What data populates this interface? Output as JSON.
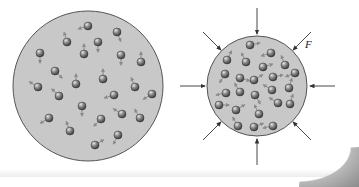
{
  "diagram": {
    "colors": {
      "container_fill": "#c8c8c8",
      "container_stroke": "#555555",
      "particle_fill": "#6f6f6f",
      "particle_highlight": "#d8d8d8",
      "velocity_arrow": "#8a8a8a",
      "force_arrow": "#333333"
    },
    "left_container": {
      "label": "uncompressed gas",
      "cx": 88,
      "cy": 86,
      "r": 75,
      "particles": [
        [
          88,
          26,
          -1,
          0.3
        ],
        [
          67,
          42,
          -0.3,
          -1
        ],
        [
          117,
          32,
          0.4,
          1
        ],
        [
          98,
          42,
          0,
          1
        ],
        [
          40,
          53,
          0,
          1
        ],
        [
          84,
          54,
          0,
          -1
        ],
        [
          121,
          55,
          0,
          1
        ],
        [
          141,
          62,
          0,
          -1
        ],
        [
          55,
          71,
          1,
          1
        ],
        [
          103,
          79,
          0,
          -1
        ],
        [
          76,
          84,
          0,
          -1
        ],
        [
          38,
          87,
          -1,
          -0.6
        ],
        [
          135,
          87,
          -0.4,
          -1
        ],
        [
          59,
          96,
          -0.8,
          -0.8
        ],
        [
          114,
          95,
          -1,
          0.3
        ],
        [
          152,
          94,
          -1,
          0.6
        ],
        [
          82,
          106,
          0,
          1
        ],
        [
          122,
          114,
          -1,
          -0.6
        ],
        [
          140,
          118,
          -0.6,
          -1
        ],
        [
          49,
          118,
          -1,
          0.6
        ],
        [
          101,
          119,
          -1,
          1
        ],
        [
          70,
          131,
          -0.4,
          -1
        ],
        [
          118,
          135,
          -0.5,
          1
        ],
        [
          95,
          145,
          1,
          -0.6
        ]
      ]
    },
    "right_container": {
      "label": "compressed gas",
      "cx": 257,
      "cy": 86,
      "r": 50,
      "particles": [
        [
          250,
          45,
          1,
          -0.2
        ],
        [
          271,
          53,
          -1,
          0.3
        ],
        [
          227,
          60,
          0.5,
          -1
        ],
        [
          246,
          62,
          -0.5,
          -1
        ],
        [
          263,
          67,
          1,
          -0.3
        ],
        [
          285,
          65,
          -0.4,
          -1
        ],
        [
          225,
          74,
          -0.6,
          1
        ],
        [
          240,
          78,
          1,
          0.3
        ],
        [
          254,
          80,
          1,
          -0.6
        ],
        [
          273,
          77,
          1,
          -0.2
        ],
        [
          295,
          73,
          -1,
          0.4
        ],
        [
          226,
          93,
          -1,
          0.2
        ],
        [
          240,
          92,
          -0.6,
          -1
        ],
        [
          255,
          95,
          0.6,
          1
        ],
        [
          272,
          90,
          -1,
          -0.6
        ],
        [
          289,
          88,
          0.3,
          -1
        ],
        [
          219,
          105,
          1,
          0
        ],
        [
          236,
          110,
          1,
          -0.6
        ],
        [
          259,
          114,
          -0.5,
          -1
        ],
        [
          278,
          103,
          -1,
          -0.6
        ],
        [
          290,
          104,
          0.3,
          -1
        ],
        [
          238,
          126,
          -0.6,
          -1
        ],
        [
          254,
          127,
          1,
          -0.4
        ],
        [
          273,
          126,
          -1,
          0.2
        ]
      ]
    },
    "force_arrows": [
      {
        "from": [
          257,
          8
        ],
        "to": [
          257,
          34
        ]
      },
      {
        "from": [
          257,
          165
        ],
        "to": [
          257,
          139
        ]
      },
      {
        "from": [
          180,
          86
        ],
        "to": [
          205,
          86
        ]
      },
      {
        "from": [
          335,
          86
        ],
        "to": [
          310,
          86
        ]
      },
      {
        "from": [
          203,
          32
        ],
        "to": [
          221,
          50
        ]
      },
      {
        "from": [
          311,
          32
        ],
        "to": [
          293,
          50
        ]
      },
      {
        "from": [
          203,
          140
        ],
        "to": [
          221,
          122
        ]
      },
      {
        "from": [
          311,
          140
        ],
        "to": [
          293,
          122
        ]
      }
    ],
    "force_label": {
      "text": "F",
      "x": 305,
      "y": 50
    }
  }
}
